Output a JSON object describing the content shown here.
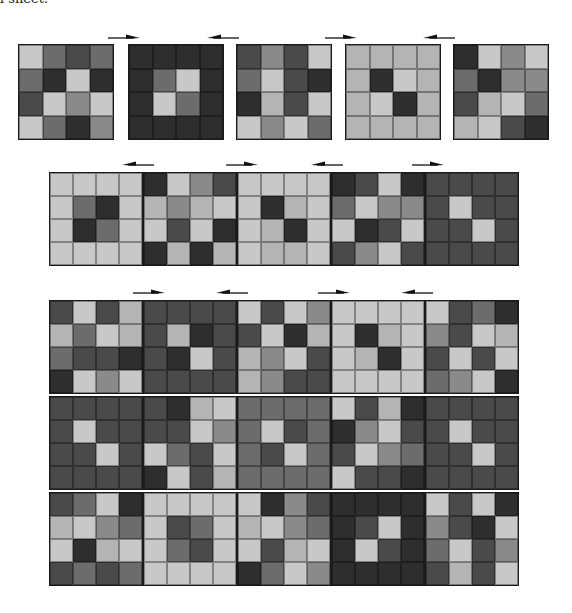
{
  "caption": "l sheet.",
  "palette": {
    "L": "#c8c8c8",
    "l": "#b4b4b4",
    "M": "#8a8a8a",
    "m": "#6c6c6c",
    "D": "#4a4a4a",
    "K": "#2e2e2e"
  },
  "groups": [
    {
      "name": "row-1",
      "tile_size": 96,
      "tiles": [
        {
          "x": 18,
          "y": 44,
          "cells": [
            "L",
            "m",
            "D",
            "m",
            "m",
            "K",
            "L",
            "K",
            "D",
            "L",
            "M",
            "L",
            "L",
            "m",
            "K",
            "M"
          ]
        },
        {
          "x": 128,
          "y": 44,
          "cells": [
            "K",
            "K",
            "K",
            "K",
            "K",
            "m",
            "L",
            "K",
            "K",
            "L",
            "m",
            "K",
            "K",
            "K",
            "K",
            "K"
          ]
        },
        {
          "x": 236,
          "y": 44,
          "cells": [
            "D",
            "M",
            "D",
            "L",
            "m",
            "L",
            "D",
            "K",
            "K",
            "l",
            "D",
            "L",
            "L",
            "M",
            "L",
            "m"
          ]
        },
        {
          "x": 345,
          "y": 44,
          "cells": [
            "l",
            "l",
            "l",
            "l",
            "l",
            "K",
            "L",
            "l",
            "l",
            "L",
            "K",
            "l",
            "l",
            "l",
            "l",
            "l"
          ]
        },
        {
          "x": 453,
          "y": 44,
          "cells": [
            "K",
            "L",
            "M",
            "L",
            "m",
            "K",
            "M",
            "M",
            "D",
            "l",
            "L",
            "m",
            "l",
            "L",
            "D",
            "K"
          ]
        }
      ],
      "arrows": [
        {
          "x": 108,
          "y": 33,
          "dir": "right"
        },
        {
          "x": 207,
          "y": 33,
          "dir": "left"
        },
        {
          "x": 325,
          "y": 33,
          "dir": "right"
        },
        {
          "x": 423,
          "y": 33,
          "dir": "left"
        }
      ]
    },
    {
      "name": "row-2",
      "tile_size": 94,
      "tiles": [
        {
          "x": 49,
          "y": 172,
          "cells": [
            "L",
            "L",
            "L",
            "L",
            "L",
            "m",
            "K",
            "L",
            "L",
            "K",
            "m",
            "L",
            "L",
            "L",
            "L",
            "L"
          ]
        },
        {
          "x": 143,
          "y": 172,
          "cells": [
            "K",
            "L",
            "M",
            "D",
            "l",
            "M",
            "l",
            "L",
            "L",
            "D",
            "L",
            "K",
            "K",
            "l",
            "K",
            "l"
          ]
        },
        {
          "x": 237,
          "y": 172,
          "cells": [
            "L",
            "L",
            "L",
            "L",
            "L",
            "K",
            "l",
            "L",
            "L",
            "l",
            "K",
            "L",
            "L",
            "l",
            "l",
            "L"
          ]
        },
        {
          "x": 331,
          "y": 172,
          "cells": [
            "K",
            "D",
            "L",
            "K",
            "m",
            "L",
            "M",
            "M",
            "L",
            "K",
            "D",
            "L",
            "D",
            "M",
            "L",
            "D"
          ]
        },
        {
          "x": 425,
          "y": 172,
          "cells": [
            "D",
            "D",
            "D",
            "D",
            "D",
            "L",
            "D",
            "D",
            "D",
            "D",
            "L",
            "D",
            "D",
            "D",
            "D",
            "D"
          ]
        }
      ],
      "arrows": [
        {
          "x": 122,
          "y": 160,
          "dir": "left"
        },
        {
          "x": 226,
          "y": 160,
          "dir": "right"
        },
        {
          "x": 311,
          "y": 160,
          "dir": "left"
        },
        {
          "x": 412,
          "y": 160,
          "dir": "right"
        }
      ]
    },
    {
      "name": "row-3-grid",
      "tile_size": 94,
      "tiles": [
        {
          "x": 49,
          "y": 300,
          "cells": [
            "D",
            "L",
            "D",
            "l",
            "l",
            "m",
            "L",
            "l",
            "m",
            "D",
            "D",
            "K",
            "K",
            "L",
            "M",
            "L"
          ]
        },
        {
          "x": 143,
          "y": 300,
          "cells": [
            "D",
            "D",
            "D",
            "D",
            "D",
            "l",
            "K",
            "D",
            "D",
            "K",
            "L",
            "D",
            "D",
            "D",
            "D",
            "D"
          ]
        },
        {
          "x": 237,
          "y": 300,
          "cells": [
            "L",
            "D",
            "L",
            "M",
            "D",
            "L",
            "K",
            "l",
            "l",
            "M",
            "L",
            "D",
            "l",
            "M",
            "D",
            "D"
          ]
        },
        {
          "x": 331,
          "y": 300,
          "cells": [
            "L",
            "L",
            "L",
            "L",
            "L",
            "K",
            "l",
            "L",
            "L",
            "l",
            "K",
            "L",
            "L",
            "L",
            "L",
            "L"
          ]
        },
        {
          "x": 425,
          "y": 300,
          "cells": [
            "L",
            "D",
            "m",
            "K",
            "M",
            "D",
            "L",
            "l",
            "D",
            "L",
            "D",
            "L",
            "m",
            "M",
            "L",
            "K"
          ]
        },
        {
          "x": 49,
          "y": 396,
          "cells": [
            "D",
            "D",
            "D",
            "D",
            "D",
            "L",
            "D",
            "D",
            "D",
            "D",
            "L",
            "D",
            "D",
            "D",
            "D",
            "D"
          ]
        },
        {
          "x": 143,
          "y": 396,
          "cells": [
            "D",
            "K",
            "l",
            "L",
            "D",
            "D",
            "L",
            "M",
            "L",
            "m",
            "D",
            "L",
            "K",
            "L",
            "D",
            "l"
          ]
        },
        {
          "x": 237,
          "y": 396,
          "cells": [
            "m",
            "m",
            "m",
            "m",
            "m",
            "L",
            "D",
            "m",
            "m",
            "D",
            "L",
            "m",
            "m",
            "m",
            "m",
            "m"
          ]
        },
        {
          "x": 331,
          "y": 396,
          "cells": [
            "L",
            "D",
            "l",
            "K",
            "K",
            "M",
            "L",
            "D",
            "D",
            "L",
            "M",
            "m",
            "L",
            "D",
            "D",
            "K"
          ]
        },
        {
          "x": 425,
          "y": 396,
          "cells": [
            "D",
            "D",
            "D",
            "D",
            "D",
            "L",
            "D",
            "D",
            "D",
            "D",
            "L",
            "D",
            "D",
            "D",
            "D",
            "D"
          ]
        },
        {
          "x": 49,
          "y": 492,
          "cells": [
            "D",
            "m",
            "L",
            "K",
            "l",
            "L",
            "M",
            "m",
            "L",
            "K",
            "l",
            "L",
            "D",
            "m",
            "D",
            "m"
          ]
        },
        {
          "x": 143,
          "y": 492,
          "cells": [
            "L",
            "L",
            "L",
            "L",
            "L",
            "D",
            "m",
            "L",
            "L",
            "m",
            "D",
            "L",
            "L",
            "L",
            "L",
            "L"
          ]
        },
        {
          "x": 237,
          "y": 492,
          "cells": [
            "L",
            "K",
            "M",
            "D",
            "l",
            "L",
            "M",
            "m",
            "L",
            "D",
            "l",
            "L",
            "K",
            "m",
            "L",
            "M"
          ]
        },
        {
          "x": 331,
          "y": 492,
          "cells": [
            "K",
            "K",
            "K",
            "K",
            "K",
            "D",
            "L",
            "K",
            "K",
            "L",
            "D",
            "K",
            "K",
            "K",
            "K",
            "K"
          ]
        },
        {
          "x": 425,
          "y": 492,
          "cells": [
            "L",
            "D",
            "L",
            "K",
            "M",
            "D",
            "K",
            "L",
            "m",
            "L",
            "D",
            "M",
            "D",
            "l",
            "D",
            "L"
          ]
        }
      ],
      "arrows": [
        {
          "x": 133,
          "y": 288,
          "dir": "right"
        },
        {
          "x": 216,
          "y": 288,
          "dir": "left"
        },
        {
          "x": 318,
          "y": 288,
          "dir": "right"
        },
        {
          "x": 401,
          "y": 288,
          "dir": "left"
        }
      ]
    }
  ]
}
